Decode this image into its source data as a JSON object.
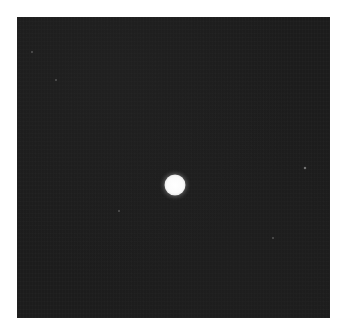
{
  "image": {
    "description": "Dark night-sky photograph with a single bright star near center",
    "background_color": "#ffffff",
    "field_color": "#1c1c1c",
    "frame": {
      "left": 17,
      "top": 17,
      "width": 313,
      "height": 301
    },
    "stars": [
      {
        "name": "bright-star",
        "x": 175,
        "y": 185,
        "diameter": 21,
        "kind": "main"
      },
      {
        "name": "faint-star-1",
        "x": 305,
        "y": 168,
        "diameter": 3,
        "kind": "faint"
      },
      {
        "name": "faint-star-2",
        "x": 119,
        "y": 211,
        "diameter": 2,
        "kind": "faint"
      },
      {
        "name": "faint-star-3",
        "x": 273,
        "y": 238,
        "diameter": 2,
        "kind": "faint"
      },
      {
        "name": "faint-star-4",
        "x": 32,
        "y": 52,
        "diameter": 2,
        "kind": "faint"
      },
      {
        "name": "faint-star-5",
        "x": 56,
        "y": 80,
        "diameter": 2,
        "kind": "faint"
      }
    ]
  }
}
